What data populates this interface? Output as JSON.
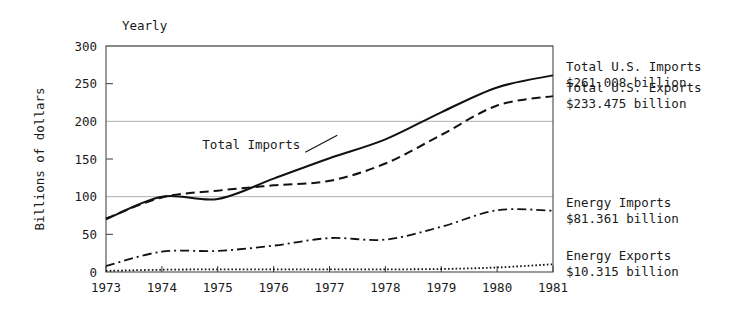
{
  "chart_data": {
    "type": "line",
    "title": "Yearly",
    "xlabel": "",
    "ylabel": "Billions of dollars",
    "x": [
      1973,
      1974,
      1975,
      1976,
      1977,
      1978,
      1979,
      1980,
      1981
    ],
    "categories": [
      "1973",
      "1974",
      "1975",
      "1976",
      "1977",
      "1978",
      "1979",
      "1980",
      "1981"
    ],
    "xlim": [
      1973,
      1981
    ],
    "ylim": [
      0,
      300
    ],
    "yticks": [
      0,
      50,
      100,
      150,
      200,
      250,
      300
    ],
    "yticklabels": [
      "0",
      "50",
      "100",
      "150",
      "200",
      "250",
      "300"
    ],
    "gridlines_major": [
      100,
      200,
      300
    ],
    "ticks_minor": [
      50,
      150,
      250
    ],
    "grid": "horizontal-major-only",
    "legend_position": "right-outside",
    "series": [
      {
        "name": "Total U.S. Imports",
        "style": "solid",
        "values": [
          70,
          100,
          97,
          124,
          151,
          176,
          212,
          245,
          261.008
        ],
        "final_value": 261.008,
        "label_line1": "Total U.S. Imports",
        "label_line2": "$261.008 billion"
      },
      {
        "name": "Total U.S. Exports",
        "style": "dashed",
        "values": [
          71,
          99,
          108,
          115,
          121,
          144,
          182,
          221,
          233.475
        ],
        "final_value": 233.475,
        "label_line1": "Total U.S. Exports",
        "label_line2": "$233.475 billion"
      },
      {
        "name": "Energy Imports",
        "style": "dash-dot",
        "values": [
          8,
          27,
          28,
          35,
          45,
          43,
          60,
          82,
          81.361
        ],
        "final_value": 81.361,
        "label_line1": "Energy Imports",
        "label_line2": "$81.361 billion"
      },
      {
        "name": "Energy Exports",
        "style": "dotted",
        "values": [
          1.5,
          3,
          3.5,
          3.5,
          3.5,
          3.5,
          4,
          6,
          10.315
        ],
        "final_value": 10.315,
        "label_line1": "Energy Exports",
        "label_line2": "$10.315 billion"
      }
    ],
    "annotations": [
      {
        "text": "Total Imports",
        "x": 1975.6,
        "y": 163,
        "has_leader_line": true
      }
    ]
  },
  "legend": {
    "entries": [
      {
        "line1": "Total U.S. Imports",
        "line2": "$261.008 billion"
      },
      {
        "line1": "Total U.S. Exports",
        "line2": "$233.475 billion"
      },
      {
        "line1": "Energy Imports",
        "line2": "$81.361 billion"
      },
      {
        "line1": "Energy Exports",
        "line2": "$10.315 billion"
      }
    ]
  }
}
